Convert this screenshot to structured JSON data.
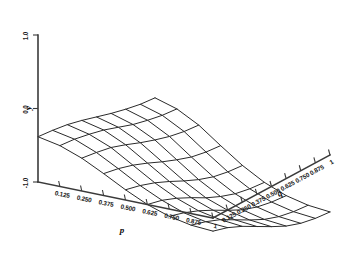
{
  "chart_data": {
    "type": "surface",
    "title": "",
    "xlabel": "p",
    "ylabel": "q",
    "zlabel": "y",
    "grid": false,
    "legend": "none",
    "projection": "3d-wireframe",
    "x": [
      0.0,
      0.125,
      0.25,
      0.375,
      0.5,
      0.625,
      0.75,
      0.875,
      1.0
    ],
    "y": [
      0.0,
      0.125,
      0.25,
      0.375,
      0.5,
      0.625,
      0.75,
      0.875,
      1.0
    ],
    "xtick_labels": [
      "0.125",
      "0.250",
      "0.375",
      "0.500",
      "0.625",
      "0.750",
      "0.875",
      "1"
    ],
    "ytick_labels": [
      "0.125",
      "0.250",
      "0.375",
      "0.500",
      "0.625",
      "0.750",
      "0.875",
      "1"
    ],
    "ztick_labels": [
      "1.0",
      "0.0",
      "-1.0"
    ],
    "zlim": [
      -1.0,
      1.0
    ],
    "xlim": [
      0.0,
      1.0
    ],
    "ylim": [
      0.0,
      1.0
    ],
    "z_matrix": [
      [
        0.62,
        0.6,
        0.57,
        0.52,
        0.46,
        0.4,
        0.35,
        0.31,
        0.29
      ],
      [
        0.56,
        0.54,
        0.5,
        0.45,
        0.38,
        0.31,
        0.26,
        0.22,
        0.2
      ],
      [
        0.45,
        0.42,
        0.38,
        0.31,
        0.23,
        0.16,
        0.1,
        0.06,
        0.04
      ],
      [
        0.3,
        0.26,
        0.2,
        0.12,
        0.03,
        -0.05,
        -0.12,
        -0.16,
        -0.18
      ],
      [
        0.14,
        0.09,
        0.02,
        -0.07,
        -0.17,
        -0.26,
        -0.33,
        -0.37,
        -0.39
      ],
      [
        0.0,
        -0.05,
        -0.13,
        -0.23,
        -0.34,
        -0.43,
        -0.5,
        -0.54,
        -0.56
      ],
      [
        -0.1,
        -0.16,
        -0.24,
        -0.34,
        -0.45,
        -0.55,
        -0.62,
        -0.66,
        -0.68
      ],
      [
        -0.16,
        -0.22,
        -0.3,
        -0.41,
        -0.52,
        -0.62,
        -0.69,
        -0.73,
        -0.75
      ],
      [
        -0.18,
        -0.24,
        -0.33,
        -0.44,
        -0.55,
        -0.65,
        -0.72,
        -0.76,
        -0.78
      ]
    ]
  },
  "axes": {
    "p_axis": {
      "title": "p",
      "ticks": [
        "0.125",
        "0.250",
        "0.375",
        "0.500",
        "0.625",
        "0.750",
        "0.875",
        "1"
      ]
    },
    "q_axis": {
      "title": "q",
      "ticks": [
        "0.125",
        "0.250",
        "0.375",
        "0.500",
        "0.625",
        "0.750",
        "0.875",
        "1"
      ]
    },
    "y_axis": {
      "title": "y",
      "ticks": [
        "1.0",
        "0.0",
        "-1.0"
      ]
    }
  },
  "style": {
    "mesh_color": "#2a2a2a",
    "axis_color": "#3a3a3a",
    "text_color": "#1a1a1a",
    "background": "#ffffff"
  }
}
